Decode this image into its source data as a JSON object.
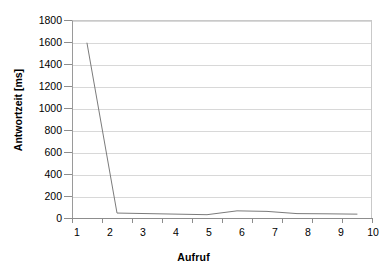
{
  "chart_data": {
    "type": "line",
    "title": "",
    "xlabel": "Aufruf",
    "ylabel": "Antwortzeit [ms]",
    "categories": [
      "1",
      "2",
      "3",
      "4",
      "5",
      "6",
      "7",
      "8",
      "9",
      "10"
    ],
    "x": [
      1,
      2,
      3,
      4,
      5,
      6,
      7,
      8,
      9,
      10
    ],
    "series": [
      {
        "name": "Antwortzeit",
        "values": [
          1590,
          45,
          40,
          35,
          30,
          65,
          60,
          40,
          38,
          35
        ],
        "color": "#7b7b7b"
      }
    ],
    "ylim": [
      0,
      1800
    ],
    "ytick_step": 200,
    "yticks": [
      0,
      200,
      400,
      600,
      800,
      1000,
      1200,
      1400,
      1600,
      1800
    ],
    "ytick_labels": [
      "0",
      "200",
      "400",
      "600",
      "800",
      "1000",
      "1200",
      "1400",
      "1600",
      "1800"
    ],
    "xlim": [
      1,
      10
    ],
    "grid": "horizontal",
    "legend": "none",
    "gridline_color": "#d8d8d8",
    "axis_color": "#8d8d8d",
    "background": "#ffffff"
  }
}
